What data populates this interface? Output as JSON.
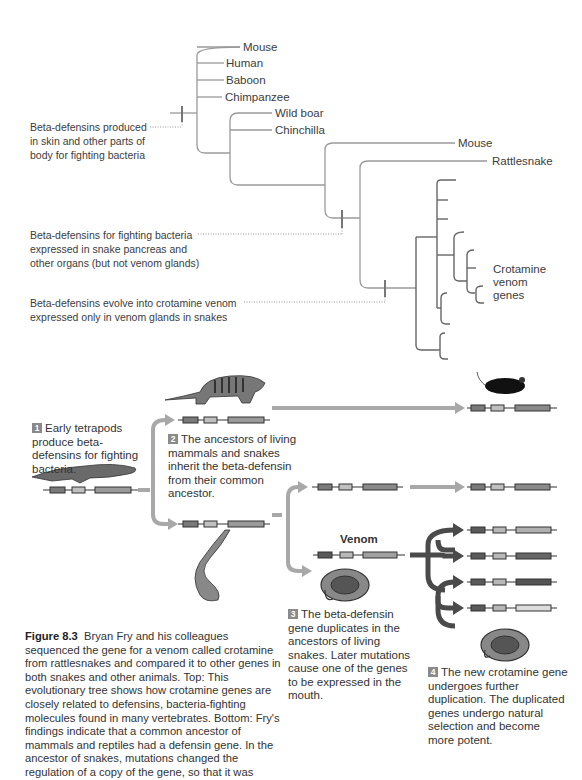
{
  "tree": {
    "leaves": [
      "Mouse",
      "Human",
      "Baboon",
      "Chimpanzee",
      "Wild boar",
      "Chinchilla",
      "Mouse",
      "Rattlesnake"
    ],
    "crotamine_label": [
      "Crotamine",
      "venom",
      "genes"
    ],
    "annotations": [
      [
        "Beta-defensins produced",
        "in skin and other parts of",
        "body for fighting bacteria"
      ],
      [
        "Beta-defensins for fighting bacteria",
        "expressed in snake pancreas and",
        "other organs (but not venom glands)"
      ],
      [
        "Beta-defensins evolve into crotamine venom",
        "expressed only in venom glands in snakes"
      ]
    ]
  },
  "steps": [
    {
      "num": "1",
      "text": "Early tetrapods produce beta-defensins for fighting bacteria."
    },
    {
      "num": "2",
      "text": "The ancestors of living mammals and snakes inherit the beta-defensin from their common ancestor."
    },
    {
      "num": "3",
      "text": "The beta-defensin gene duplicates in the ancestors of living snakes. Later mutations cause one of the genes to be expressed in the mouth."
    },
    {
      "num": "4",
      "text": "The new crotamine gene undergoes further duplication. The duplicated genes undergo natural selection and become more potent."
    }
  ],
  "venom_label": "Venom",
  "caption": {
    "title": "Figure 8.3",
    "text": "Bryan Fry and his colleagues sequenced the gene for a venom called crotamine from rattlesnakes and compared it to other genes in both snakes and other animals. Top: This evolutionary tree shows how crotamine genes are closely related to defensins, bacteria-fighting molecules found in many vertebrates. Bottom: Fry's findings indicate that a common ancestor of mammals and reptiles had a defensin gene. In the ancestor of snakes, mutations changed the regulation of a copy of the gene, so that it was"
  },
  "colors": {
    "tree_line": "#9a9a9a",
    "dark_line": "#666666",
    "arrow_light": "#a8a8a8",
    "arrow_dark": "#4a4a4a",
    "exon_dark": "#7a7a7a",
    "exon_light": "#c8c8c8"
  }
}
